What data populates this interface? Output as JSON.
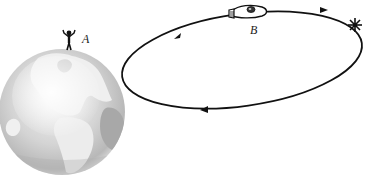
{
  "diagram": {
    "labels": {
      "observer": "A",
      "spaceship": "B"
    },
    "elements": {
      "earth": {
        "name": "earth-globe",
        "center": [
          62,
          112
        ],
        "radius": 63
      },
      "observer": {
        "name": "person-A",
        "position": [
          68,
          38
        ]
      },
      "orbit": {
        "name": "elliptical-orbit",
        "center": [
          242,
          58
        ],
        "rx": 121,
        "ry": 48,
        "rotation_deg": -8,
        "direction": "counterclockwise-visual (arrows: up-right on upper-left, right on upper-right, left on bottom)"
      },
      "spaceship": {
        "name": "spaceship-B",
        "position": [
          245,
          12
        ]
      },
      "event": {
        "name": "star-burst",
        "position": [
          355,
          25
        ]
      }
    },
    "colors": {
      "line": "#111111",
      "earth_ocean": "#c8c8c8",
      "earth_land": "#eeeeee",
      "earth_shadow": "#9a9a9a",
      "background": "#ffffff"
    }
  }
}
